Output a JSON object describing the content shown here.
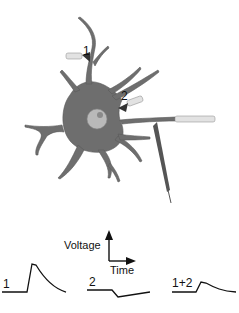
{
  "diagram": {
    "synapse_labels": [
      "1",
      "2"
    ],
    "axis": {
      "y_label": "Voltage",
      "x_label": "Time"
    },
    "traces": [
      {
        "label": "1",
        "shape": "excitatory-psp"
      },
      {
        "label": "2",
        "shape": "inhibitory-psp"
      },
      {
        "label": "1+2",
        "shape": "summed-psp"
      }
    ],
    "colors": {
      "neuron": "#6e6e6e",
      "nucleus": "#b9b9b9",
      "nucleolus": "#8a8a8a",
      "electrode": "#d8d8d8",
      "line": "#111111"
    }
  }
}
